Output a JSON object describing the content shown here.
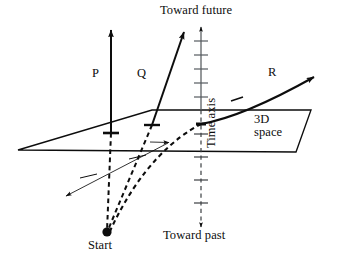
{
  "figure": {
    "background_color": "#ffffff",
    "ink_color": "#0d0d0d",
    "labels": {
      "toward_future": "Toward future",
      "toward_past": "Toward past",
      "start": "Start",
      "time_axis": "Time axis",
      "space_line_1": "3D",
      "space_line_2": "space",
      "worldline_p": "P",
      "worldline_q": "Q",
      "worldline_r": "R"
    },
    "elements": {
      "plane_name": "3D space plane",
      "time_axis_name": "vertical time axis",
      "spatial_axis_name": "in-plane spatial axis arrow",
      "start_point_name": "common start event",
      "worldlines": [
        {
          "id": "P",
          "style": "straight vertical thick",
          "description": "stationary worldline, parallel to time axis"
        },
        {
          "id": "Q",
          "style": "straight slanted",
          "description": "uniform motion worldline"
        },
        {
          "id": "R",
          "style": "curved",
          "description": "accelerating worldline"
        }
      ]
    },
    "time_axis_ticks": {
      "future_count": 5,
      "past_count": 4
    }
  }
}
